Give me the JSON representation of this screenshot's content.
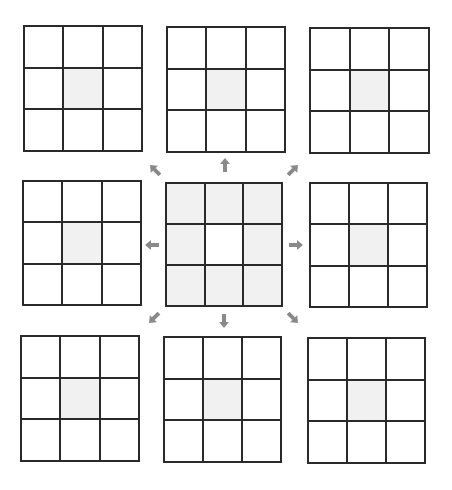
{
  "diagram": {
    "colors": {
      "line": "#2a2a2a",
      "shade": "#f1f1f1",
      "arrow": "#8a8a8a",
      "background": "#ffffff"
    },
    "grids": [
      {
        "id": "top-left",
        "x": 23,
        "y": 25,
        "w": 120,
        "h": 127,
        "shaded": [
          4
        ]
      },
      {
        "id": "top-center",
        "x": 166,
        "y": 26,
        "w": 120,
        "h": 127,
        "shaded": [
          4
        ]
      },
      {
        "id": "top-right",
        "x": 309,
        "y": 27,
        "w": 121,
        "h": 127,
        "shaded": [
          4
        ]
      },
      {
        "id": "middle-left",
        "x": 22,
        "y": 180,
        "w": 120,
        "h": 126,
        "shaded": [
          4
        ]
      },
      {
        "id": "center",
        "x": 165,
        "y": 182,
        "w": 118,
        "h": 125,
        "shaded": [
          0,
          1,
          2,
          3,
          5,
          6,
          7,
          8
        ]
      },
      {
        "id": "middle-right",
        "x": 309,
        "y": 182,
        "w": 119,
        "h": 126,
        "shaded": [
          4
        ]
      },
      {
        "id": "bottom-left",
        "x": 20,
        "y": 335,
        "w": 120,
        "h": 127,
        "shaded": [
          4
        ]
      },
      {
        "id": "bottom-center",
        "x": 163,
        "y": 336,
        "w": 119,
        "h": 127,
        "shaded": [
          4
        ]
      },
      {
        "id": "bottom-right",
        "x": 307,
        "y": 337,
        "w": 119,
        "h": 127,
        "shaded": [
          4
        ]
      }
    ],
    "arrows": [
      {
        "dir": "up-left",
        "x": 147,
        "y": 162,
        "angle": -45
      },
      {
        "dir": "up",
        "x": 217,
        "y": 157,
        "angle": 0
      },
      {
        "dir": "up-right",
        "x": 285,
        "y": 162,
        "angle": 45
      },
      {
        "dir": "left",
        "x": 144,
        "y": 237,
        "angle": -90
      },
      {
        "dir": "right",
        "x": 288,
        "y": 237,
        "angle": 90
      },
      {
        "dir": "down-left",
        "x": 146,
        "y": 310,
        "angle": -135
      },
      {
        "dir": "down",
        "x": 216,
        "y": 313,
        "angle": 180
      },
      {
        "dir": "down-right",
        "x": 285,
        "y": 310,
        "angle": 135
      }
    ]
  }
}
